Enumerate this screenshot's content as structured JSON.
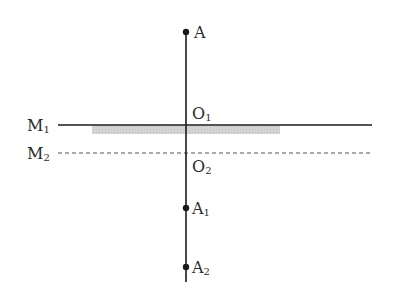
{
  "diagram": {
    "type": "plane-mirror-reflection",
    "colors": {
      "line": "#1a1a1a",
      "dashed_line": "#555555",
      "mirror_shading": "#cfcfcf",
      "text": "#2a2a2a"
    },
    "axis": {
      "x": 186,
      "y_top": 32,
      "y_bottom": 282
    },
    "mirrors": [
      {
        "id": "M1",
        "label_main": "M",
        "label_sub": "1",
        "style": "solid",
        "y": 125,
        "x_start": 58,
        "x_end": 372,
        "shading": {
          "x_start": 92,
          "x_end": 280,
          "height": 8
        }
      },
      {
        "id": "M2",
        "label_main": "M",
        "label_sub": "2",
        "style": "dashed",
        "y": 153,
        "x_start": 58,
        "x_end": 370
      }
    ],
    "points": [
      {
        "id": "A",
        "label_main": "A",
        "label_sub": "",
        "y": 32,
        "has_dot": true
      },
      {
        "id": "O1",
        "label_main": "O",
        "label_sub": "1",
        "y": 113,
        "has_dot": false
      },
      {
        "id": "O2",
        "label_main": "O",
        "label_sub": "2",
        "y": 166,
        "has_dot": false
      },
      {
        "id": "A1",
        "label_main": "A",
        "label_sub": "1",
        "y": 208,
        "has_dot": true
      },
      {
        "id": "A2",
        "label_main": "A",
        "label_sub": "2",
        "y": 267,
        "has_dot": true
      }
    ]
  }
}
